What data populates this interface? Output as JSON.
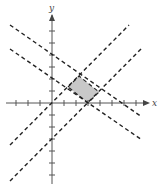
{
  "diagram": {
    "title": "",
    "axes": {
      "x_label": "x",
      "y_label": "y",
      "origin_px": [
        52,
        103
      ],
      "tick_spacing_px": 12,
      "x_ticks": [
        -3,
        -2,
        -1,
        1,
        2,
        3,
        4,
        5,
        6,
        7
      ],
      "y_ticks": [
        -6,
        -5,
        -4,
        -3,
        -2,
        -1,
        1,
        2,
        3,
        4,
        5
      ]
    },
    "lines": [
      {
        "name": "line-y-equals-x",
        "style": "dashed",
        "slope": 1,
        "intercept": 0
      },
      {
        "name": "line-y-equals-x-minus-3",
        "style": "dashed",
        "slope": 1,
        "intercept": -3
      },
      {
        "name": "line-upper-decreasing",
        "style": "dashed",
        "slope": -0.8,
        "intercept": 4
      },
      {
        "name": "line-lower-decreasing",
        "style": "dashed",
        "slope": -0.8,
        "intercept": 2.4
      }
    ],
    "shaded_region": {
      "name": "feasible-region",
      "fill": "#c8c8c8",
      "vertices": [
        [
          1.33,
          1.33
        ],
        [
          2.22,
          2.22
        ],
        [
          3.89,
          0.89
        ],
        [
          3,
          0
        ]
      ]
    }
  }
}
